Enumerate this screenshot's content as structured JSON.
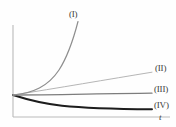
{
  "figure": {
    "title": "",
    "background_color": "#fefefe",
    "axis_color": "#b9b9b9",
    "label_color": "#3a3a3a"
  },
  "axes": {
    "x_axis_label": "t",
    "y_axis_label": "",
    "origin_px": [
      13,
      95
    ],
    "x_axis_y_px": 117,
    "y_axis_x_px": 13,
    "x_axis_extent_px": [
      13,
      170
    ],
    "y_axis_extent_px": [
      25,
      117
    ]
  },
  "labels": {
    "curve_i": "(I)",
    "curve_ii": "(II)",
    "curve_iii": "(III)",
    "curve_iv": "(IV)",
    "t_axis": "t"
  },
  "chart_data": {
    "type": "line",
    "title": "",
    "xlabel": "t",
    "ylabel": "",
    "grid": false,
    "legend": "inline-curve-end-labels",
    "xlim": [
      0,
      1
    ],
    "ylim": [
      -0.25,
      1.05
    ],
    "note": "Four qualitative solution curves all starting from a common point at t=0; (I) grows exponentially, (II) rises approximately linearly, (III) stays nearly constant, (IV) decays monotonically.",
    "series": [
      {
        "name": "(I)",
        "label": "(I)",
        "color": "#8e8e8e",
        "width": 1.2,
        "shape": "exponential-growth",
        "x": [
          0.0,
          0.08,
          0.16,
          0.24,
          0.32,
          0.4,
          0.46
        ],
        "y": [
          0.0,
          0.05,
          0.14,
          0.28,
          0.5,
          0.78,
          1.0
        ],
        "points_px": [
          [
            13,
            95
          ],
          [
            26,
            92
          ],
          [
            39,
            86
          ],
          [
            52,
            75
          ],
          [
            64,
            58
          ],
          [
            72,
            38
          ],
          [
            78,
            22
          ]
        ],
        "label_pos_px": [
          69,
          10
        ]
      },
      {
        "name": "(II)",
        "label": "(II)",
        "color": "#adadad",
        "width": 0.9,
        "shape": "slow-linear-growth",
        "x": [
          0.0,
          0.25,
          0.5,
          0.75,
          1.0
        ],
        "y": [
          0.0,
          0.045,
          0.095,
          0.145,
          0.19
        ],
        "points_px": [
          [
            13,
            95
          ],
          [
            48,
            89
          ],
          [
            83,
            84
          ],
          [
            118,
            78
          ],
          [
            152,
            72
          ]
        ],
        "label_pos_px": [
          155,
          64
        ]
      },
      {
        "name": "(III)",
        "label": "(III)",
        "color": "#7d7d7d",
        "width": 1.3,
        "shape": "nearly-constant",
        "x": [
          0.0,
          0.25,
          0.5,
          0.75,
          1.0
        ],
        "y": [
          0.0,
          -0.006,
          -0.012,
          -0.017,
          -0.022
        ],
        "points_px": [
          [
            13,
            95
          ],
          [
            48,
            95
          ],
          [
            83,
            94
          ],
          [
            118,
            93
          ],
          [
            152,
            93
          ]
        ],
        "label_pos_px": [
          154,
          85
        ]
      },
      {
        "name": "(IV)",
        "label": "(IV)",
        "color": "#1c1c1c",
        "width": 2.0,
        "shape": "exponential-decay",
        "x": [
          0.0,
          0.25,
          0.5,
          0.75,
          1.0
        ],
        "y": [
          0.0,
          -0.065,
          -0.105,
          -0.13,
          -0.145
        ],
        "points_px": [
          [
            13,
            95
          ],
          [
            48,
            101
          ],
          [
            83,
            105
          ],
          [
            118,
            108
          ],
          [
            152,
            109
          ]
        ],
        "label_pos_px": [
          154,
          101
        ]
      }
    ]
  }
}
